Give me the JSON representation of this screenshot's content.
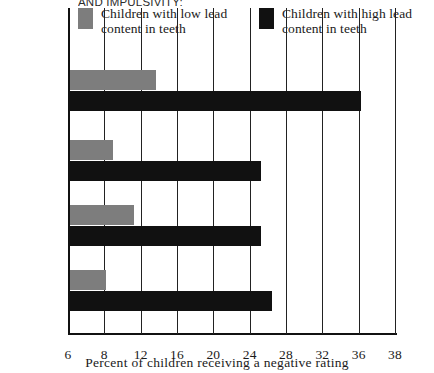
{
  "chart_data": {
    "type": "bar",
    "orientation": "horizontal",
    "title": "AND IMPULSIVITY:",
    "xlabel": "Percent of children receiving a negative rating",
    "ylabel": "",
    "categories": [
      "Distractible",
      "Impulsive",
      "Easily\nfrustrated",
      "Low overall\nfunctioning"
    ],
    "series": [
      {
        "name": "Children with low lead\ncontent in teeth",
        "color": "#7d7d7d",
        "values": [
          13.5,
          8.7,
          11.0,
          8.0
        ]
      },
      {
        "name": "Children with high lead\ncontent in teeth",
        "color": "#111111",
        "values": [
          36.0,
          25.0,
          25.0,
          26.2
        ]
      }
    ],
    "xticks": [
      6,
      8,
      12,
      16,
      20,
      24,
      28,
      32,
      36,
      38
    ],
    "xtick_labels": [
      "6",
      "8",
      "12",
      "16",
      "20",
      "24",
      "28",
      "32",
      "36",
      "38"
    ],
    "xlim": [
      6,
      38
    ],
    "grid": true,
    "legend_position": "top"
  },
  "legend": {
    "entries": [
      {
        "label": "Children with low lead\ncontent in teeth",
        "color": "#7d7d7d"
      },
      {
        "label": "Children with high lead\ncontent in teeth",
        "color": "#111111"
      }
    ]
  }
}
